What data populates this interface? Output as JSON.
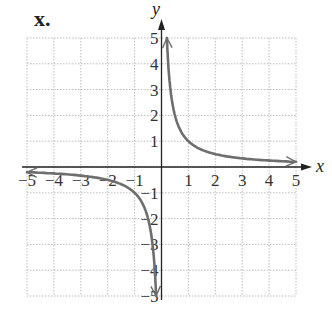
{
  "panel_label": "x.",
  "chart_data": {
    "type": "line",
    "title": "",
    "function": "y = 1/x",
    "xlabel": "x",
    "ylabel": "y",
    "xlim": [
      -5,
      5
    ],
    "ylim": [
      -5,
      5
    ],
    "grid": true,
    "legend": null,
    "x_ticks": [
      -5,
      -4,
      -3,
      -2,
      -1,
      1,
      2,
      3,
      4,
      5
    ],
    "y_ticks": [
      -5,
      -4,
      -3,
      -2,
      -1,
      1,
      2,
      3,
      4,
      5
    ],
    "x_tick_labels": [
      "−5",
      "−4",
      "−3",
      "−2",
      "−1",
      "1",
      "2",
      "3",
      "4",
      "5"
    ],
    "y_tick_labels": [
      "−5",
      "−4",
      "−3",
      "−2",
      "−1",
      "1",
      "2",
      "3",
      "4",
      "5"
    ],
    "series": [
      {
        "name": "right branch",
        "x": [
          0.2,
          0.25,
          0.333,
          0.5,
          1,
          2,
          3,
          4,
          5
        ],
        "y": [
          5,
          4,
          3,
          2,
          1,
          0.5,
          0.333,
          0.25,
          0.2
        ],
        "arrows": "both ends"
      },
      {
        "name": "left branch",
        "x": [
          -5,
          -4,
          -3,
          -2,
          -1,
          -0.5,
          -0.333,
          -0.25,
          -0.2
        ],
        "y": [
          -0.2,
          -0.25,
          -0.333,
          -0.5,
          -1,
          -2,
          -3,
          -4,
          -5
        ],
        "arrows": "both ends"
      }
    ],
    "colors": {
      "curve": "#6e6e6e",
      "axis": "#222222",
      "grid": "#bdbdbd"
    }
  }
}
